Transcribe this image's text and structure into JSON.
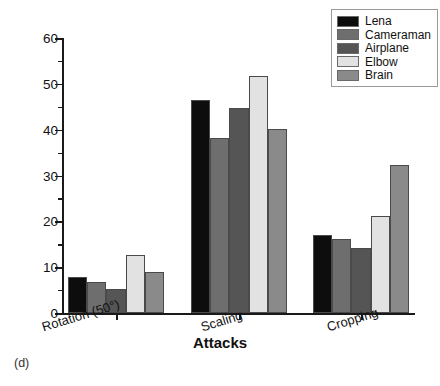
{
  "panel_label": "(d)",
  "legend": {
    "position": "top-right",
    "entries": [
      {
        "label": "Lena",
        "color": "#0d0d0d"
      },
      {
        "label": "Cameraman",
        "color": "#6e6e6e"
      },
      {
        "label": "Airplane",
        "color": "#555555"
      },
      {
        "label": "Elbow",
        "color": "#e2e2e2"
      },
      {
        "label": "Brain",
        "color": "#8a8a8a"
      }
    ]
  },
  "chart_data": {
    "type": "bar",
    "title": "",
    "xlabel": "Attacks",
    "ylabel": "PSNR (dB)",
    "ylim": [
      0,
      60
    ],
    "ytick_step": 10,
    "yticks": [
      0,
      10,
      20,
      30,
      40,
      50,
      60
    ],
    "ytick_labels": [
      "0",
      "10",
      "20",
      "30",
      "40",
      "50",
      "60"
    ],
    "minor_ticks": true,
    "grid": false,
    "categories": [
      "Rotation (50°)",
      "Scaling",
      "Cropping"
    ],
    "series": [
      {
        "name": "Lena",
        "color": "#0d0d0d",
        "values": [
          7.8,
          46.4,
          17.1
        ]
      },
      {
        "name": "Cameraman",
        "color": "#6e6e6e",
        "values": [
          6.7,
          38.1,
          16.1
        ]
      },
      {
        "name": "Airplane",
        "color": "#555555",
        "values": [
          5.2,
          44.7,
          14.1
        ]
      },
      {
        "name": "Elbow",
        "color": "#e2e2e2",
        "values": [
          12.7,
          51.8,
          21.1
        ]
      },
      {
        "name": "Brain",
        "color": "#8a8a8a",
        "values": [
          9.0,
          40.2,
          32.2
        ]
      }
    ]
  }
}
